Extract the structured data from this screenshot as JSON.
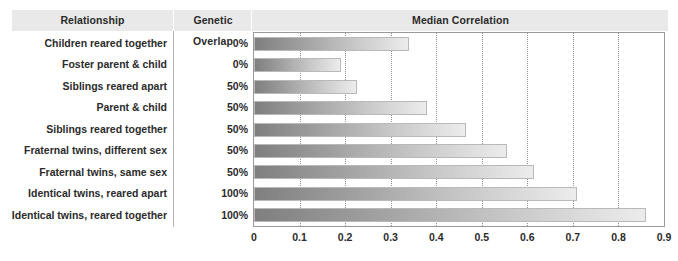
{
  "table": {
    "headers": {
      "relationship": "Relationship",
      "genetic_overlap": "Genetic Overlap",
      "median_correlation": "Median Correlation"
    }
  },
  "chart_data": {
    "type": "bar",
    "orientation": "horizontal",
    "title": "Median Correlation",
    "xlabel": "",
    "ylabel": "Relationship",
    "xlim": [
      0,
      0.9
    ],
    "xticks": [
      "0",
      "0.1",
      "0.2",
      "0.3",
      "0.4",
      "0.5",
      "0.6",
      "0.7",
      "0.8",
      "0.9"
    ],
    "xtick_values": [
      0,
      0.1,
      0.2,
      0.3,
      0.4,
      0.5,
      0.6,
      0.7,
      0.8,
      0.9
    ],
    "grid": true,
    "legend": false,
    "categories": [
      "Children reared together",
      "Foster parent & child",
      "Siblings reared apart",
      "Parent & child",
      "Siblings reared together",
      "Fraternal twins, different sex",
      "Fraternal twins, same sex",
      "Identical twins, reared apart",
      "Identical twins, reared together"
    ],
    "values": [
      0.34,
      0.19,
      0.225,
      0.38,
      0.465,
      0.555,
      0.615,
      0.71,
      0.86
    ],
    "genetic_overlap": [
      "0%",
      "0%",
      "50%",
      "50%",
      "50%",
      "50%",
      "50%",
      "100%",
      "100%"
    ],
    "bar_gradient_start": "#7f7f7f",
    "bar_gradient_end": "#ececec",
    "header_band_color": "#e9e9e9"
  }
}
